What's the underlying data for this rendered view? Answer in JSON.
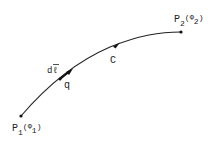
{
  "diagram": {
    "curve": {
      "label": "C",
      "color": "#222222"
    },
    "start_point": {
      "name": "P",
      "subscript": "1",
      "potential": "Φ",
      "potential_subscript": "1"
    },
    "end_point": {
      "name": "P",
      "subscript": "2",
      "potential": "Φ",
      "potential_subscript": "2"
    },
    "line_element": {
      "label": "d",
      "vector_symbol": "ℓ"
    },
    "charge": {
      "label": "q"
    }
  }
}
